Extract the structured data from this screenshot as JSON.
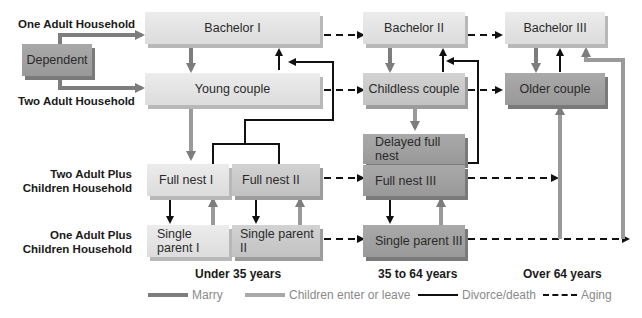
{
  "row_labels": {
    "one_adult": "One Adult Household",
    "two_adult": "Two Adult Household",
    "two_adult_children_1": "Two Adult Plus",
    "two_adult_children_2": "Children Household",
    "one_adult_children_1": "One Adult Plus",
    "one_adult_children_2": "Children Household"
  },
  "age_labels": {
    "young": "Under 35 years",
    "middle": "35 to 64 years",
    "old": "Over 64 years"
  },
  "nodes": {
    "dependent": "Dependent",
    "bachelor1": "Bachelor I",
    "young_couple": "Young couple",
    "full_nest1": "Full nest I",
    "full_nest2": "Full nest II",
    "single_parent1": "Single parent I",
    "single_parent2": "Single parent II",
    "bachelor2": "Bachelor II",
    "childless_couple": "Childless couple",
    "delayed_full_nest": "Delayed full nest",
    "full_nest3": "Full nest III",
    "single_parent3": "Single parent III",
    "bachelor3": "Bachelor III",
    "older_couple": "Older couple"
  },
  "legend": {
    "marry": "Marry",
    "children": "Children enter or leave",
    "divorce": "Divorce/death",
    "aging": "Aging"
  },
  "colors": {
    "marry": "#7d7d7d",
    "children": "#9a9a9a",
    "divorce": "#111111",
    "aging": "#111111"
  }
}
